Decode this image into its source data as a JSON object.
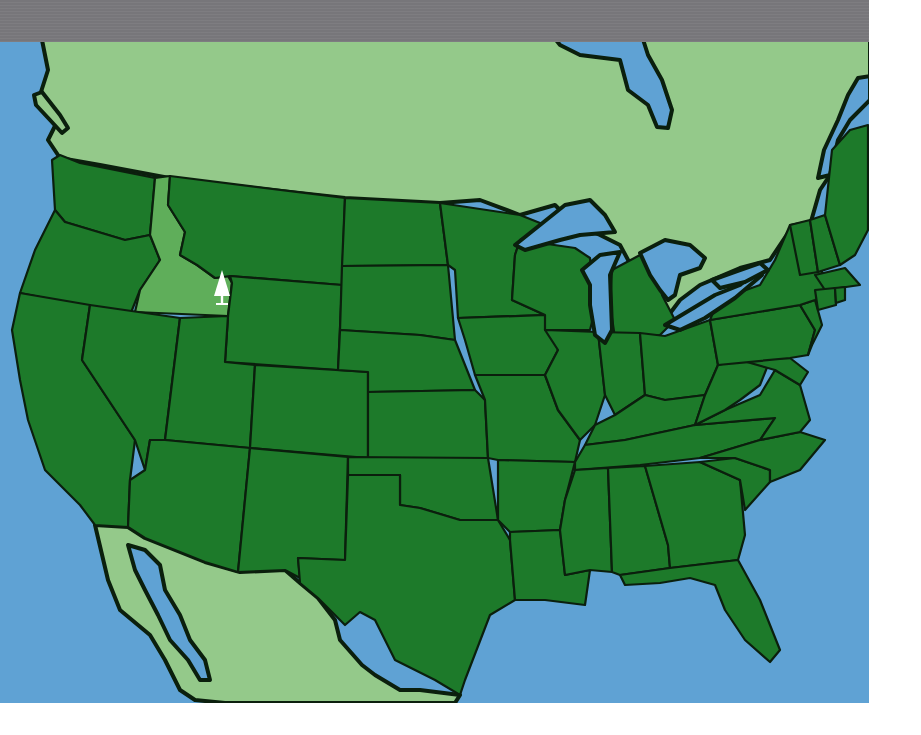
{
  "map": {
    "title": "United States map with highlighted state",
    "highlighted_state": "Idaho",
    "marker": {
      "icon": "pine-tree-icon",
      "label": "Idaho",
      "x": 222,
      "y": 292
    },
    "colors": {
      "banner": "#77767a",
      "water": "#5fa2d4",
      "neighbor_land": "#94c98a",
      "state_fill": "#1d7a2a",
      "highlighted_state_fill": "#5fae5a",
      "border": "#0b1f0d",
      "marker": "#ffffff"
    },
    "states": [
      "Washington",
      "Oregon",
      "California",
      "Idaho",
      "Nevada",
      "Montana",
      "Wyoming",
      "Utah",
      "Arizona",
      "Colorado",
      "New Mexico",
      "North Dakota",
      "South Dakota",
      "Nebraska",
      "Kansas",
      "Oklahoma",
      "Texas",
      "Minnesota",
      "Iowa",
      "Missouri",
      "Arkansas",
      "Louisiana",
      "Wisconsin",
      "Illinois",
      "Michigan",
      "Indiana",
      "Ohio",
      "Kentucky",
      "Tennessee",
      "Mississippi",
      "Alabama",
      "Georgia",
      "Florida",
      "South Carolina",
      "North Carolina",
      "Virginia",
      "West Virginia",
      "Maryland",
      "Delaware",
      "Pennsylvania",
      "New Jersey",
      "New York",
      "Connecticut",
      "Rhode Island",
      "Massachusetts",
      "Vermont",
      "New Hampshire",
      "Maine"
    ],
    "regions": [
      "Canada",
      "Mexico",
      "Pacific Ocean",
      "Atlantic Ocean",
      "Gulf of Mexico",
      "Hudson Bay",
      "Great Lakes"
    ]
  }
}
